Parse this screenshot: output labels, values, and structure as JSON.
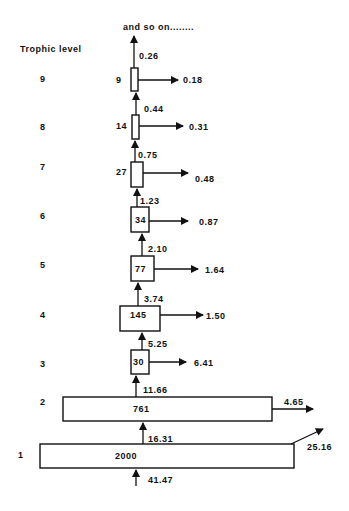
{
  "diagram": {
    "header_label": "Trophic level",
    "top_note": "and so on........",
    "levels": [
      {
        "level": "1",
        "standing": "2000",
        "input": "16.31",
        "loss": "25.16",
        "source_input": "41.47"
      },
      {
        "level": "2",
        "standing": "761",
        "input": "11.66",
        "loss": "4.65"
      },
      {
        "level": "3",
        "standing": "30",
        "input": "5.25",
        "loss": "6.41"
      },
      {
        "level": "4",
        "standing": "145",
        "input": "3.74",
        "loss": "1.50"
      },
      {
        "level": "5",
        "standing": "77",
        "input": "2.10",
        "loss": "1.64"
      },
      {
        "level": "6",
        "standing": "34",
        "input": "1.23",
        "loss": "0.87"
      },
      {
        "level": "7",
        "standing": "27",
        "input": "0.75",
        "loss": "0.48"
      },
      {
        "level": "8",
        "standing": "14",
        "input": "0.44",
        "loss": "0.31"
      },
      {
        "level": "9",
        "standing": "9",
        "input": "0.26",
        "loss": "0.18"
      }
    ]
  }
}
